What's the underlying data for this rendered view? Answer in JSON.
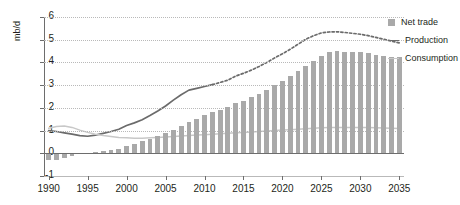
{
  "chart_data": {
    "type": "bar",
    "title": "",
    "xlabel": "",
    "ylabel": "mb/d",
    "ylim": [
      -1,
      6
    ],
    "xlim": [
      1989.4,
      2035.6
    ],
    "ytick_values": [
      -1,
      0,
      1,
      2,
      3,
      4,
      5,
      6
    ],
    "ytick_labels": [
      "-1",
      "0",
      "1",
      "2",
      "3",
      "4",
      "5",
      "6"
    ],
    "xtick_values": [
      1990,
      1995,
      2000,
      2005,
      2010,
      2015,
      2020,
      2025,
      2030,
      2035
    ],
    "xtick_labels": [
      "1990",
      "1995",
      "2000",
      "2005",
      "2010",
      "2015",
      "2020",
      "2025",
      "2030",
      "2035"
    ],
    "grid": "horizontal-dotted",
    "legend_position": "right",
    "forecast_start": 2011,
    "categories": [
      1990,
      1991,
      1992,
      1993,
      1994,
      1995,
      1996,
      1997,
      1998,
      1999,
      2000,
      2001,
      2002,
      2003,
      2004,
      2005,
      2006,
      2007,
      2008,
      2009,
      2010,
      2011,
      2012,
      2013,
      2014,
      2015,
      2016,
      2017,
      2018,
      2019,
      2020,
      2021,
      2022,
      2023,
      2024,
      2025,
      2026,
      2027,
      2028,
      2029,
      2030,
      2031,
      2032,
      2033,
      2034,
      2035
    ],
    "series": [
      {
        "name": "Net trade",
        "type": "bar",
        "color": "#a9a9a9",
        "values": [
          -0.3,
          -0.28,
          -0.2,
          -0.12,
          -0.05,
          0.02,
          0.06,
          0.1,
          0.14,
          0.2,
          0.32,
          0.42,
          0.52,
          0.62,
          0.74,
          0.88,
          1.02,
          1.18,
          1.36,
          1.52,
          1.7,
          1.82,
          1.92,
          2.02,
          2.22,
          2.32,
          2.46,
          2.62,
          2.8,
          3.0,
          3.18,
          3.4,
          3.62,
          3.86,
          4.08,
          4.3,
          4.44,
          4.5,
          4.48,
          4.44,
          4.44,
          4.4,
          4.34,
          4.3,
          4.26,
          4.22
        ]
      },
      {
        "name": "Production",
        "type": "line",
        "color": "#6b6b6b",
        "values": [
          1.0,
          0.96,
          0.9,
          0.84,
          0.78,
          0.75,
          0.8,
          0.88,
          0.96,
          1.06,
          1.22,
          1.34,
          1.48,
          1.66,
          1.86,
          2.08,
          2.34,
          2.58,
          2.78,
          2.86,
          2.94,
          3.02,
          3.12,
          3.22,
          3.4,
          3.52,
          3.66,
          3.82,
          4.0,
          4.2,
          4.38,
          4.58,
          4.8,
          5.02,
          5.18,
          5.3,
          5.34,
          5.35,
          5.32,
          5.28,
          5.24,
          5.18,
          5.1,
          5.02,
          4.94,
          4.86
        ]
      },
      {
        "name": "Consumption",
        "type": "line",
        "color": "#c8c8c8",
        "values": [
          1.1,
          1.18,
          1.2,
          1.14,
          1.02,
          0.92,
          0.84,
          0.78,
          0.74,
          0.7,
          0.68,
          0.66,
          0.66,
          0.68,
          0.7,
          0.72,
          0.74,
          0.76,
          0.78,
          0.8,
          0.82,
          0.84,
          0.86,
          0.88,
          0.9,
          0.92,
          0.94,
          0.96,
          0.98,
          1.0,
          1.02,
          1.04,
          1.06,
          1.08,
          1.1,
          1.12,
          1.13,
          1.14,
          1.14,
          1.14,
          1.14,
          1.13,
          1.12,
          1.11,
          1.1,
          1.09
        ]
      }
    ]
  },
  "legend": {
    "items": [
      {
        "label": "Net trade",
        "marker": "square-swatch",
        "color": "#a9a9a9"
      },
      {
        "label": "Production",
        "marker": "line-swatch",
        "color": "#6b6b6b"
      },
      {
        "label": "Consumption",
        "marker": "line-swatch",
        "color": "#c8c8c8"
      }
    ]
  }
}
